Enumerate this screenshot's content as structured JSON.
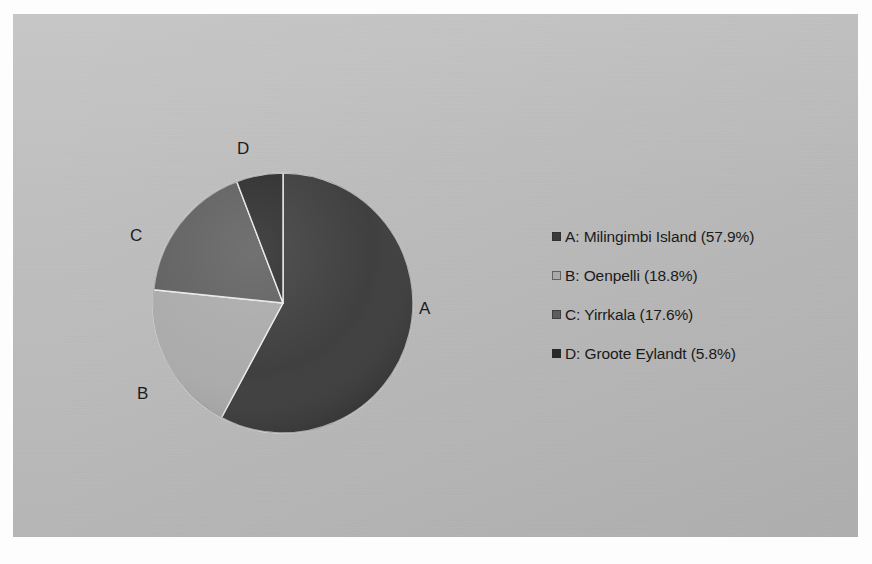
{
  "chart_data": {
    "type": "pie",
    "title": "",
    "subtitle": "",
    "xlabel": "",
    "ylabel": "",
    "legend_position": "right",
    "grid": false,
    "start_angle_deg": 0,
    "direction": "clockwise",
    "categories": [
      "A: Milingimbi Island",
      "B: Oenpelli",
      "C: Yirrkala",
      "D: Groote Eylandt"
    ],
    "keys": [
      "A",
      "B",
      "C",
      "D"
    ],
    "names": [
      "Milingimbi Island",
      "Oenpelli",
      "Yirrkala",
      "Groote Eylandt"
    ],
    "values": [
      57.9,
      18.8,
      17.6,
      5.8
    ],
    "value_unit": "%",
    "colors": [
      "#3a3a3a",
      "#a9a9a9",
      "#5d5d5d",
      "#2a2a2a"
    ],
    "annotations": [
      "A",
      "B",
      "C",
      "D"
    ]
  },
  "pie": {
    "slices": [
      {
        "key": "A",
        "label": "A",
        "value": 57.9,
        "color": "#3a3a3a"
      },
      {
        "key": "B",
        "label": "B",
        "value": 18.8,
        "color": "#a9a9a9"
      },
      {
        "key": "C",
        "label": "C",
        "value": 17.6,
        "color": "#5d5d5d"
      },
      {
        "key": "D",
        "label": "D",
        "value": 5.8,
        "color": "#2a2a2a"
      }
    ]
  },
  "legend": {
    "items": [
      {
        "marker": "legend-swatch-a",
        "color": "#3a3a3a",
        "text": "A: Milingimbi Island (57.9%)"
      },
      {
        "marker": "legend-swatch-b",
        "color": "#a9a9a9",
        "text": "B: Oenpelli (18.8%)"
      },
      {
        "marker": "legend-swatch-c",
        "color": "#5d5d5d",
        "text": "C: Yirrkala (17.6%)"
      },
      {
        "marker": "legend-swatch-d",
        "color": "#2a2a2a",
        "text": "D: Groote Eylandt (5.8%)"
      }
    ]
  },
  "labels": {
    "a": "A",
    "b": "B",
    "c": "C",
    "d": "D"
  },
  "colors": {
    "background": "#b9b9b9",
    "page": "#fdfdfd",
    "text": "#1a1a1a"
  }
}
